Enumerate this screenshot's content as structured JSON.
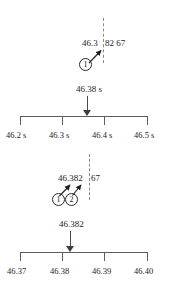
{
  "figure": {
    "type": "measurement-reading-diagram",
    "colors": {
      "ink": "#1d1d1d",
      "rule": "#5d5d5d",
      "dashed_guide": "#8a8a8a",
      "arrow": "#3d3d3d"
    }
  },
  "panels": [
    {
      "id": "panel-top",
      "name": "coarse-reading-panel",
      "callout": {
        "value_text": "46.382 67",
        "value_prefix": "46.3",
        "value_suffix": "82 67",
        "markers": [
          {
            "label": "1",
            "glyph": "①"
          }
        ]
      },
      "pointer_label": "46.38 s",
      "scale": {
        "min_label": "46.2 s",
        "max_label": "46.5 s",
        "pointer_value": "46.38",
        "ticks": [
          {
            "label": "46.2 s",
            "value": 46.2
          },
          {
            "label": "46.3 s",
            "value": 46.3
          },
          {
            "label": "46.4 s",
            "value": 46.4
          },
          {
            "label": "46.5 s",
            "value": 46.5
          }
        ],
        "unit": "s",
        "range": [
          46.2,
          46.5
        ],
        "pointer_position_fraction": 0.6
      }
    },
    {
      "id": "panel-bottom",
      "name": "fine-reading-panel",
      "callout": {
        "value_text": "46.382 67",
        "value_prefix": "46.382",
        "value_suffix": "67",
        "markers": [
          {
            "label": "1",
            "glyph": "①"
          },
          {
            "label": "2",
            "glyph": "②"
          }
        ]
      },
      "pointer_label": "46.382",
      "scale": {
        "min_label": "46.37",
        "max_label": "46.40",
        "pointer_value": "46.382",
        "ticks": [
          {
            "label": "46.37",
            "value": 46.37
          },
          {
            "label": "46.38",
            "value": 46.38
          },
          {
            "label": "46.39",
            "value": 46.39
          },
          {
            "label": "46.40",
            "value": 46.4
          }
        ],
        "unit": "",
        "range": [
          46.37,
          46.4
        ],
        "pointer_position_fraction": 0.4
      }
    }
  ]
}
